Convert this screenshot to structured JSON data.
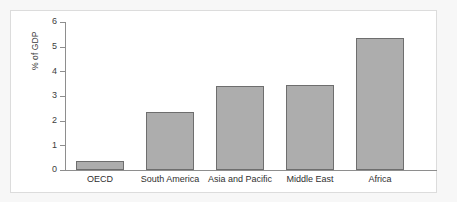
{
  "chart_data": {
    "type": "bar",
    "title": "",
    "subtitle": "",
    "xlabel": "",
    "ylabel": "% of GDP",
    "categories": [
      "OECD",
      "South America",
      "Asia and Pacific",
      "Middle East",
      "Africa"
    ],
    "values": [
      0.35,
      2.35,
      3.42,
      3.45,
      5.35
    ],
    "series": [
      {
        "name": "% of GDP",
        "values": [
          0.35,
          2.35,
          3.42,
          3.45,
          5.35
        ]
      }
    ],
    "ylim": [
      0,
      6
    ],
    "yticks": [
      0,
      1,
      2,
      3,
      4,
      5,
      6
    ],
    "ytick_labels": [
      "0",
      "1",
      "2",
      "3",
      "4",
      "5",
      "6"
    ],
    "grid": false,
    "legend": "none",
    "bar_color": "#adadad",
    "bar_border_color": "#6e6e6e",
    "axis_color": "#8e8e8e",
    "plot_background": "#ffffff",
    "page_background": "#f7f7f7"
  }
}
